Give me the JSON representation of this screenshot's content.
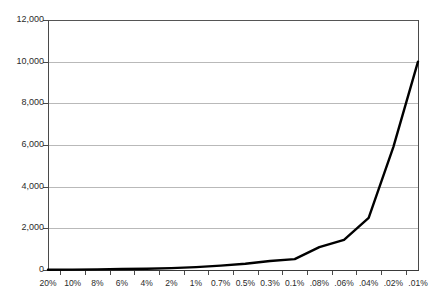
{
  "chart_data": {
    "type": "line",
    "title": "",
    "subtitle": "",
    "xlabel": "",
    "ylabel": "",
    "categories": [
      "20%",
      "10%",
      "8%",
      "6%",
      "4%",
      "2%",
      "1%",
      "0.7%",
      "0.5%",
      "0.3%",
      "0.1%",
      ".08%",
      ".06%",
      ".04%",
      ".02%",
      ".01%"
    ],
    "series": [
      {
        "name": "",
        "values": [
          10,
          20,
          30,
          45,
          60,
          90,
          140,
          210,
          300,
          430,
          520,
          1100,
          1450,
          2500,
          5900,
          10000
        ]
      }
    ],
    "ylim": [
      0,
      12000
    ],
    "yticks": [
      0,
      2000,
      4000,
      6000,
      8000,
      10000,
      12000
    ],
    "ytick_labels": [
      "0",
      "2,000",
      "4,000",
      "6,000",
      "8,000",
      "10,000",
      "12,000"
    ],
    "grid": true,
    "grid_axis": "y",
    "legend": false,
    "legend_position": "none",
    "line_color": "#000000",
    "grid_color": "#b9b9b9",
    "axis_color": "#4a4a4a",
    "background_color": "#ffffff"
  }
}
